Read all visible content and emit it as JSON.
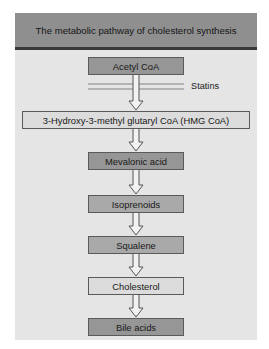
{
  "title": "The metabolic pathway of cholesterol synthesis",
  "inhibitor": {
    "label": "Statins",
    "acts_between": [
      "Acetyl CoA",
      "3-Hydroxy-3-methyl glutaryl CoA (HMG CoA)"
    ]
  },
  "steps": [
    {
      "label": "Acetyl CoA",
      "shade": "dark"
    },
    {
      "label": "3-Hydroxy-3-methyl glutaryl CoA (HMG CoA)",
      "shade": "light"
    },
    {
      "label": "Mevalonic acid",
      "shade": "dark"
    },
    {
      "label": "Isoprenoids",
      "shade": "mid"
    },
    {
      "label": "Squalene",
      "shade": "mid"
    },
    {
      "label": "Cholesterol",
      "shade": "light"
    },
    {
      "label": "Bile acids",
      "shade": "dark"
    }
  ],
  "colors": {
    "header_bg": "#8f8f8f",
    "panel_bg": "#e5e5e5",
    "box_dark": "#969696",
    "box_mid": "#a9a9a9",
    "box_light": "#dcdcdc"
  }
}
